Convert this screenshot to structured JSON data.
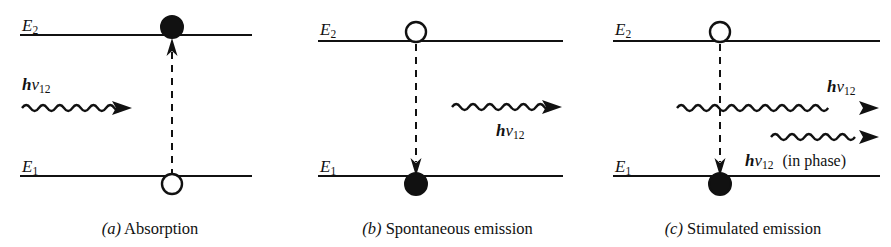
{
  "figure": {
    "background": "#ffffff",
    "ink": "#111111",
    "panels": [
      {
        "id": "a",
        "caption_tag": "(a)",
        "caption_text": "Absorption",
        "upper_level_label": "E",
        "upper_level_sub": "2",
        "lower_level_label": "E",
        "lower_level_sub": "1",
        "upper_state_marker": "filled-circle",
        "lower_state_marker": "open-circle",
        "transition_direction": "upward",
        "photons": [
          {
            "name": "incident-photon",
            "symbol_h": "h",
            "symbol_nu": "ν",
            "symbol_sub": "12",
            "note": "",
            "direction": "rightward"
          }
        ]
      },
      {
        "id": "b",
        "caption_tag": "(b)",
        "caption_text": "Spontaneous emission",
        "upper_level_label": "E",
        "upper_level_sub": "2",
        "lower_level_label": "E",
        "lower_level_sub": "1",
        "upper_state_marker": "open-circle",
        "lower_state_marker": "filled-circle",
        "transition_direction": "downward",
        "photons": [
          {
            "name": "emitted-photon",
            "symbol_h": "h",
            "symbol_nu": "ν",
            "symbol_sub": "12",
            "note": "",
            "direction": "rightward"
          }
        ]
      },
      {
        "id": "c",
        "caption_tag": "(c)",
        "caption_text": "Stimulated emission",
        "upper_level_label": "E",
        "upper_level_sub": "2",
        "lower_level_label": "E",
        "lower_level_sub": "1",
        "upper_state_marker": "open-circle",
        "lower_state_marker": "filled-circle",
        "transition_direction": "downward",
        "photons": [
          {
            "name": "incident-photon",
            "symbol_h": "h",
            "symbol_nu": "ν",
            "symbol_sub": "12",
            "note": "",
            "direction": "rightward"
          },
          {
            "name": "stimulated-photon",
            "symbol_h": "h",
            "symbol_nu": "ν",
            "symbol_sub": "12",
            "note": "(in phase)",
            "direction": "rightward"
          }
        ]
      }
    ]
  }
}
